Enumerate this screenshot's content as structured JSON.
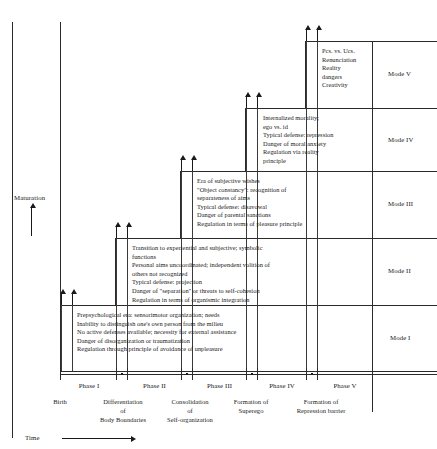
{
  "diagram": {
    "axes": {
      "y_label": "Maturation",
      "x_label": "Time",
      "origin_label": "Birth"
    },
    "modes": [
      {
        "id": "mode-1",
        "label": "Mode I",
        "text": "Prepsychological era: sensorimotor organization; needs\nInability to distinguish one's own person from the milieu\nNo active defenses available; necessity for external assistance\nDanger of disorganization or traumatization\nRegulation through principle of avoidance of unpleasure"
      },
      {
        "id": "mode-2",
        "label": "Mode II",
        "text": "Transition to experiential and subjective; symbolic\n   functions\nPersonal aims uncoordinated; independent volition of\n   others not recognized\nTypical defense: projection\nDanger of \"separation\" or threats to self-cohesion\nRegulation in terms of organismic integration"
      },
      {
        "id": "mode-3",
        "label": "Mode III",
        "text": "Era of subjective wishes\n\"Object constancy\": recognition of\n   separateness of aims\nTypical defense: disavowal\nDanger of parental sanctions\nRegulation in terms of pleasure principle"
      },
      {
        "id": "mode-4",
        "label": "Mode IV",
        "text": "Internalized morality;\n   ego vs. id\nTypical defense: repression\nDanger of moral anxiety\nRegulation via reality\n   principle"
      },
      {
        "id": "mode-5",
        "label": "Mode V",
        "text": "Pcs. vs. Ucs.\nRenunciation\nReality\n   dangers\nCreativity"
      }
    ],
    "phases": [
      {
        "id": "phase-1",
        "label": "Phase I"
      },
      {
        "id": "phase-2",
        "label": "Phase II"
      },
      {
        "id": "phase-3",
        "label": "Phase III"
      },
      {
        "id": "phase-4",
        "label": "Phase IV"
      },
      {
        "id": "phase-5",
        "label": "Phase V"
      }
    ],
    "events": [
      {
        "id": "event-1",
        "label": "Differentiation\nof\nBody Boundaries"
      },
      {
        "id": "event-2",
        "label": "Consolidation\nof\nSelf-organization"
      },
      {
        "id": "event-3",
        "label": "Formation of\nSuperego"
      },
      {
        "id": "event-4",
        "label": "Formation of\nRepression barrier"
      }
    ]
  }
}
